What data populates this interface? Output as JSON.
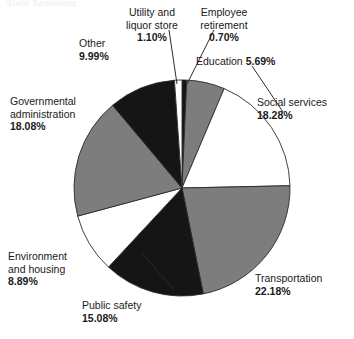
{
  "page": {
    "title_fragment": "State Spending",
    "background": "#ffffff"
  },
  "chart_data": {
    "type": "pie",
    "title": "",
    "subtitle": "",
    "xlabel": "",
    "ylabel": "",
    "legend_position": "none",
    "grid": false,
    "units": "percent",
    "center": {
      "x": 182,
      "y": 188
    },
    "radius": 108,
    "start_angle_deg": 0,
    "direction": "clockwise",
    "categories": [
      "Employee retirement",
      "Education",
      "Social services",
      "Transportation",
      "Public safety",
      "Environment and housing",
      "Governmental administration",
      "Other",
      "Utility and liquor store"
    ],
    "values": [
      0.7,
      5.69,
      18.28,
      22.18,
      15.08,
      8.89,
      18.08,
      9.99,
      1.1
    ],
    "slices": [
      {
        "label": "Employee retirement",
        "value": 0.7,
        "value_text": "0.70%",
        "color": "#151515",
        "start_deg": 0.0,
        "end_deg": 2.52
      },
      {
        "label": "Education",
        "value": 5.69,
        "value_text": "5.69%",
        "color": "#7d7d7d",
        "start_deg": 2.52,
        "end_deg": 22.98
      },
      {
        "label": "Social services",
        "value": 18.28,
        "value_text": "18.28%",
        "color": "#ffffff",
        "start_deg": 22.98,
        "end_deg": 88.79
      },
      {
        "label": "Transportation",
        "value": 22.18,
        "value_text": "22.18%",
        "color": "#7d7d7d",
        "start_deg": 88.79,
        "end_deg": 168.64
      },
      {
        "label": "Public safety",
        "value": 15.08,
        "value_text": "15.08%",
        "color": "#151515",
        "start_deg": 168.64,
        "end_deg": 222.93
      },
      {
        "label": "Environment and housing",
        "value": 8.89,
        "value_text": "8.89%",
        "color": "#ffffff",
        "start_deg": 222.93,
        "end_deg": 254.93
      },
      {
        "label": "Governmental administration",
        "value": 18.08,
        "value_text": "18.08%",
        "color": "#7d7d7d",
        "start_deg": 254.93,
        "end_deg": 320.02
      },
      {
        "label": "Other",
        "value": 9.99,
        "value_text": "9.99%",
        "color": "#151515",
        "start_deg": 320.02,
        "end_deg": 355.98
      },
      {
        "label": "Utility and liquor store",
        "value": 1.1,
        "value_text": "1.10%",
        "color": "#ffffff",
        "start_deg": 355.98,
        "end_deg": 360.0
      }
    ]
  },
  "labels": {
    "utility": {
      "line1": "Utility and",
      "line2": "liquor store",
      "pct": "1.10%"
    },
    "employee": {
      "line1": "Employee",
      "line2": "retirement",
      "pct": "0.70%"
    },
    "education": {
      "line1": "Education",
      "pct": "5.69%"
    },
    "social": {
      "line1": "Social services",
      "pct": "18.28%"
    },
    "transportation": {
      "line1": "Transportation",
      "pct": "22.18%"
    },
    "publicsafety": {
      "line1": "Public safety",
      "pct": "15.08%"
    },
    "environment": {
      "line1": "Environment",
      "line2": "and housing",
      "pct": "8.89%"
    },
    "govt": {
      "line1": "Governmental",
      "line2": "administration",
      "pct": "18.08%"
    },
    "other": {
      "line1": "Other",
      "pct": "9.99%"
    }
  }
}
